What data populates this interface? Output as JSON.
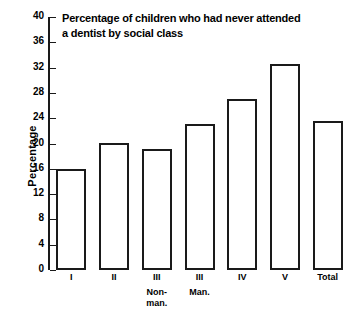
{
  "chart_data": {
    "type": "bar",
    "title": "Percentage of children who had never attended\na dentist by social  class",
    "xlabel": "",
    "ylabel": "Percentage",
    "ylim": [
      0,
      40
    ],
    "ytick_step": 4,
    "yticks": [
      "40",
      "36",
      "32",
      "28",
      "24",
      "20",
      "16",
      "12",
      "8",
      "4",
      "0"
    ],
    "grid": false,
    "legend": "none",
    "categories": [
      "I",
      "II",
      "III",
      "III",
      "IV",
      "V",
      "Total"
    ],
    "category_sublabels": [
      "",
      "",
      "Non-\nman.",
      "Man.",
      "",
      "",
      ""
    ],
    "values": [
      16.0,
      20.1,
      19.2,
      23.1,
      27.1,
      32.5,
      23.6
    ],
    "bar_style": {
      "fill": "#ffffff",
      "edge": "#1a1a1a"
    }
  }
}
